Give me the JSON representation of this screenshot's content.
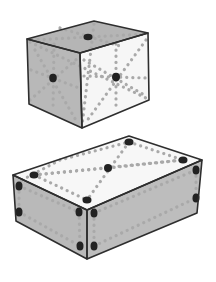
{
  "figure": {
    "colors": {
      "background": "#ffffff",
      "edge": "#2e2e2e",
      "shaded_face": "#b8b8b8",
      "light_face": "#f4f4f4",
      "dotted_line": "#a9a9a9",
      "marker_dot": "#222222"
    },
    "cube": {
      "faces": {
        "top": "27,39 94,21 148,33 80,53",
        "left": "27,39 80,53 82,128 29,104",
        "right": "80,53 148,33 149,100 82,128"
      },
      "face_fills": {
        "top": "#b5b5b5",
        "left": "#b8b8b8",
        "right": "#f6f6f6"
      },
      "dots": [
        {
          "name": "top-face-center",
          "cx": 88,
          "cy": 37,
          "rx": 4.5,
          "ry": 3.2
        },
        {
          "name": "left-face-center",
          "cx": 53,
          "cy": 78,
          "rx": 3.8,
          "ry": 4.2
        },
        {
          "name": "right-face-center",
          "cx": 116,
          "cy": 77,
          "rx": 4,
          "ry": 4.2
        }
      ],
      "dotted_lines": [
        "M30,42 L146,98",
        "M94,24 L82,126",
        "M54,44 L53,110",
        "M31,70 L79,88",
        "M30,100 L78,58",
        "M35,50 L77,122",
        "M116,44 L116,110",
        "M84,76 L146,78",
        "M84,60 L146,96",
        "M146,40 L86,122",
        "M60,28 L120,46",
        "M32,40 L146,34"
      ]
    },
    "box": {
      "faces": {
        "top": "13,175 129,136 202,160 87,210",
        "left": "13,175 87,210 87,259 16,221",
        "right": "87,210 202,160 197,213 87,259"
      },
      "face_fills": {
        "top": "#f7f7f7",
        "left": "#b9b9b9",
        "right": "#bdbdbd"
      },
      "dots": [
        {
          "name": "top-back-corner",
          "cx": 129,
          "cy": 142,
          "rx": 4.5,
          "ry": 3.5
        },
        {
          "name": "top-left-corner",
          "cx": 34,
          "cy": 175,
          "rx": 4.5,
          "ry": 3.5
        },
        {
          "name": "top-right-corner",
          "cx": 183,
          "cy": 160,
          "rx": 4.5,
          "ry": 3.5
        },
        {
          "name": "top-front-corner",
          "cx": 87,
          "cy": 200,
          "rx": 4.5,
          "ry": 3.5
        },
        {
          "name": "top-center",
          "cx": 108,
          "cy": 168,
          "rx": 4,
          "ry": 4
        },
        {
          "name": "left-upper-left",
          "cx": 19,
          "cy": 186,
          "rx": 3.5,
          "ry": 4.5
        },
        {
          "name": "left-lower-left",
          "cx": 19,
          "cy": 212,
          "rx": 3.5,
          "ry": 4.5
        },
        {
          "name": "left-upper-right",
          "cx": 79,
          "cy": 212,
          "rx": 3.5,
          "ry": 4.5
        },
        {
          "name": "left-lower-right",
          "cx": 80,
          "cy": 246,
          "rx": 3.5,
          "ry": 4.5
        },
        {
          "name": "right-upper-left",
          "cx": 94,
          "cy": 213,
          "rx": 3.5,
          "ry": 4.5
        },
        {
          "name": "right-lower-left",
          "cx": 94,
          "cy": 246,
          "rx": 3.5,
          "ry": 4.5
        },
        {
          "name": "right-upper-right",
          "cx": 196,
          "cy": 170,
          "rx": 3.5,
          "ry": 4.5
        },
        {
          "name": "right-lower-right",
          "cx": 196,
          "cy": 198,
          "rx": 3.5,
          "ry": 4.5
        }
      ],
      "dotted_lines": [
        "M34,175 L183,160",
        "M129,142 L87,200",
        "M34,175 L87,200",
        "M129,142 L183,160",
        "M34,175 L108,168",
        "M108,168 L183,160",
        "M19,186 L79,212",
        "M19,212 L80,246",
        "M79,212 L80,246",
        "M19,186 L19,212",
        "M94,213 L196,170",
        "M94,246 L196,198",
        "M94,213 L94,246",
        "M196,170 L196,198",
        "M22,180 L60,160 L129,142"
      ]
    }
  }
}
